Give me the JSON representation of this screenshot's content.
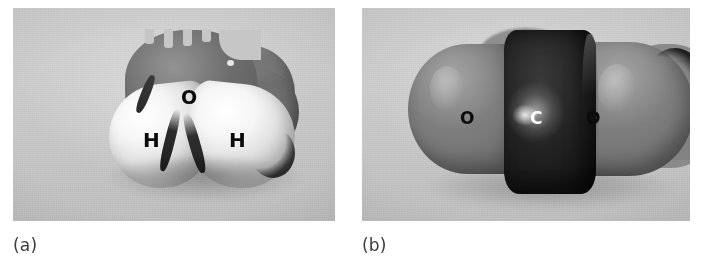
{
  "figure": {
    "type": "photograph-pair",
    "background_color": "#ffffff",
    "panel_background_color": "#c6c6c6"
  },
  "panels": [
    {
      "id": "a",
      "caption": "(a)",
      "molecule": "water",
      "formula": "H2O",
      "atoms": [
        {
          "label": "O",
          "element": "oxygen",
          "color": "#6a6a6a",
          "label_color": "#0b0b0b"
        },
        {
          "label": "H",
          "element": "hydrogen",
          "color": "#f6f6f6",
          "label_color": "#0b0b0b"
        },
        {
          "label": "H",
          "element": "hydrogen",
          "color": "#f6f6f6",
          "label_color": "#0b0b0b"
        }
      ]
    },
    {
      "id": "b",
      "caption": "(b)",
      "molecule": "carbon dioxide",
      "formula": "CO2",
      "atoms": [
        {
          "label": "O",
          "element": "oxygen",
          "color": "#7a7a7a",
          "label_color": "#0b0b0b"
        },
        {
          "label": "C",
          "element": "carbon",
          "color": "#141414",
          "label_color": "#ffffff"
        },
        {
          "label": "O",
          "element": "oxygen",
          "color": "#7a7a7a",
          "label_color": "#0b0b0b"
        }
      ]
    }
  ]
}
